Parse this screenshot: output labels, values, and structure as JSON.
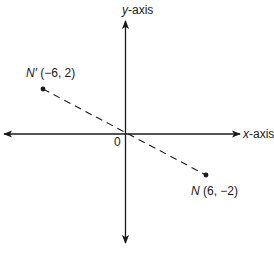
{
  "diagram": {
    "type": "coordinate-plane-reflection",
    "axes": {
      "x_label_var": "x",
      "x_label_rest": "-axis",
      "y_label_var": "y",
      "y_label_rest": "-axis",
      "origin_label": "0"
    },
    "points": [
      {
        "name": "N′",
        "coords_text": "(−6, 2)",
        "x": -6,
        "y": 2
      },
      {
        "name": "N",
        "coords_text": "(6, −2)",
        "x": 6,
        "y": -2
      }
    ],
    "connector": {
      "style": "dashed",
      "from": "N′",
      "to": "N",
      "passes_through": "origin"
    },
    "colors": {
      "ink": "#1a1a1a",
      "background": "#ffffff"
    }
  }
}
